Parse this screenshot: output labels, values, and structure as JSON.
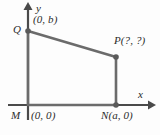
{
  "figure": {
    "background_color": "#fdfdfd",
    "stroke_color": "#6b6b6b",
    "axis_color": "#4a4a4a",
    "label_color": "#2b2b2b",
    "axes": {
      "x_label": "x",
      "y_label": "y",
      "origin_px": [
        28,
        105
      ],
      "x_axis_y_px": 105,
      "y_axis_x_px": 28,
      "x_arrow_tip_px": [
        152,
        105
      ],
      "y_arrow_tip_px": [
        28,
        3
      ]
    },
    "points": [
      {
        "name": "M",
        "label": "M",
        "coord_label": "(0, 0)",
        "px": [
          28,
          105
        ],
        "has_dot": false
      },
      {
        "name": "N",
        "label": "N(a, 0)",
        "coord_label": "(a, 0)",
        "px": [
          116,
          105
        ],
        "has_dot": true
      },
      {
        "name": "P",
        "label": "P(?, ?)",
        "coord_label": "(?, ?)",
        "px": [
          116,
          57
        ],
        "has_dot": true
      },
      {
        "name": "Q",
        "label": "Q",
        "coord_label": "(0, b)",
        "px": [
          28,
          31
        ],
        "has_dot": true
      }
    ],
    "shape": {
      "type": "quadrilateral",
      "vertices_px": [
        [
          28,
          105
        ],
        [
          116,
          105
        ],
        [
          116,
          57
        ],
        [
          28,
          31
        ]
      ],
      "name": "MNPQ"
    }
  }
}
